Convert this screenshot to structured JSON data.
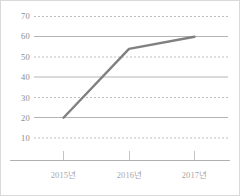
{
  "chart_data": {
    "type": "line",
    "title": "",
    "subtitle": "",
    "xlabel": "",
    "ylabel": "",
    "categories": [
      "2015년",
      "2016년",
      "2017년"
    ],
    "series": [
      {
        "name": "series-1",
        "values": [
          20,
          54,
          60
        ],
        "color": "#808080"
      }
    ],
    "ylim": [
      0,
      70
    ],
    "yticks": [
      10,
      20,
      30,
      40,
      50,
      60,
      70
    ],
    "ytick_labels": [
      "10",
      "20",
      "30",
      "40",
      "50",
      "60",
      "70"
    ],
    "gridlines": {
      "solid_at": [
        20,
        40,
        60
      ],
      "dashed_at": [
        10,
        30,
        50,
        70
      ],
      "solid_color": "#b4b4b4",
      "dashed_color": "#bdbdbd"
    },
    "axis": {
      "bottom_axis_color": "#b0b0b0",
      "tick_color": "#c0c0c0",
      "show_y_axis_line": false,
      "show_legend": false,
      "show_markers": false
    },
    "frame": {
      "border_color": "#d9d9d9",
      "background": "#ffffff"
    }
  }
}
